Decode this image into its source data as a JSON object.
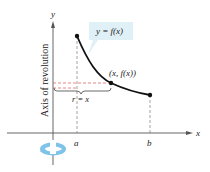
{
  "diagram": {
    "axis_labels": {
      "x": "x",
      "y": "y"
    },
    "tick_labels": {
      "a": "a",
      "b": "b"
    },
    "curve_label": "y = f(x)",
    "point_label": "(x,  f(x))",
    "radius_label": "r = x",
    "axis_of_revolution_label": "Axis of revolution",
    "colors": {
      "curve": "#111111",
      "dashed": "#e05050",
      "label_box": "#dff0f7",
      "rotation_icon": "#7fc3e8"
    }
  }
}
